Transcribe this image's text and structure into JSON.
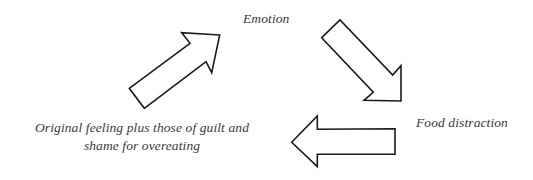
{
  "diagram": {
    "type": "cycle",
    "nodes": [
      {
        "id": "emotion",
        "label": "Emotion"
      },
      {
        "id": "food",
        "label": "Food distraction"
      },
      {
        "id": "original",
        "label_lines": [
          "Original feeling plus those of guilt and",
          "shame for overeating"
        ]
      }
    ],
    "edges": [
      {
        "from": "original",
        "to": "emotion",
        "direction": "up-right"
      },
      {
        "from": "emotion",
        "to": "food",
        "direction": "down-right"
      },
      {
        "from": "food",
        "to": "original",
        "direction": "left"
      }
    ],
    "colors": {
      "arrow_stroke": "#1a1a1a",
      "arrow_fill": "#ffffff",
      "text": "#3a3a3a",
      "background": "#ffffff"
    }
  }
}
